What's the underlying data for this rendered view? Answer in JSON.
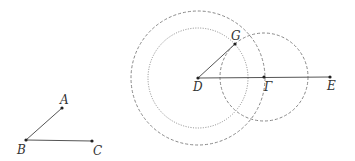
{
  "diagram": {
    "type": "geometric-construction",
    "left_figure": {
      "points": [
        {
          "id": "A",
          "label": "A",
          "x": 62,
          "y": 108,
          "lx": 60,
          "ly": 104
        },
        {
          "id": "B",
          "label": "B",
          "x": 26,
          "y": 140,
          "lx": 17,
          "ly": 154
        },
        {
          "id": "C",
          "label": "C",
          "x": 92,
          "y": 141,
          "lx": 93,
          "ly": 155
        }
      ],
      "segments": [
        [
          "B",
          "A"
        ],
        [
          "B",
          "C"
        ]
      ]
    },
    "right_figure": {
      "points": [
        {
          "id": "D",
          "label": "D",
          "x": 198,
          "y": 78,
          "lx": 193,
          "ly": 91
        },
        {
          "id": "G",
          "label": "G",
          "x": 235,
          "y": 44,
          "lx": 231,
          "ly": 40
        },
        {
          "id": "Gamma",
          "label": "Γ",
          "x": 264,
          "y": 77,
          "lx": 264,
          "ly": 91
        },
        {
          "id": "E",
          "label": "E",
          "x": 330,
          "y": 77,
          "lx": 327,
          "ly": 90
        }
      ],
      "segments": [
        [
          "D",
          "G"
        ],
        [
          "D",
          "E"
        ]
      ],
      "circles": [
        {
          "name": "outer-dashed-circle-D",
          "cx": 198,
          "cy": 78,
          "r": 67,
          "style": "dashed"
        },
        {
          "name": "dotted-circle-D",
          "cx": 198,
          "cy": 78,
          "r": 50,
          "style": "dotted"
        },
        {
          "name": "dashed-circle-Gamma",
          "cx": 264,
          "cy": 77,
          "r": 44,
          "style": "dashed"
        }
      ]
    },
    "colors": {
      "line": "#555555",
      "circle": "#888888",
      "point": "#222222"
    }
  }
}
